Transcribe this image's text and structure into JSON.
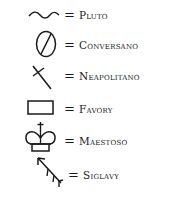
{
  "legend": {
    "stroke_color": "#1a1a1a",
    "items": [
      {
        "symbol": "wave-icon",
        "equals": "=",
        "label": "Pluto"
      },
      {
        "symbol": "circle-slash-icon",
        "equals": "=",
        "label": "Conversano"
      },
      {
        "symbol": "cross-diagonal-icon",
        "equals": "=",
        "label": "Neapolitano"
      },
      {
        "symbol": "rectangle-icon",
        "equals": "=",
        "label": "Favory"
      },
      {
        "symbol": "crown-icon",
        "equals": "=",
        "label": "Maestoso"
      },
      {
        "symbol": "arrow-feathered-icon",
        "equals": "=",
        "label": "Siglavy"
      }
    ]
  }
}
